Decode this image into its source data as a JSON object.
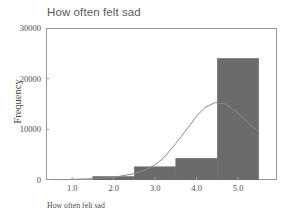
{
  "chart_data": {
    "type": "bar",
    "title": "How often felt sad",
    "xlabel": "How often felt sad",
    "ylabel": "Frequency",
    "xlim": [
      0.37,
      5.94
    ],
    "ylim": [
      0,
      30000
    ],
    "xticks": [
      "1.0",
      "2.0",
      "3.0",
      "4.0",
      "5.0"
    ],
    "xtick_values": [
      1.0,
      2.0,
      3.0,
      4.0,
      5.0
    ],
    "yticks": [
      "0",
      "10000",
      "20000",
      "30000"
    ],
    "ytick_values": [
      0,
      10000,
      20000,
      30000
    ],
    "grid": false,
    "legend": "none",
    "bin_width": 1.0,
    "bin_edges": [
      0.5,
      1.5,
      2.5,
      3.5,
      4.5,
      5.5
    ],
    "categories": [
      "1",
      "2",
      "3",
      "4",
      "5"
    ],
    "values": [
      0,
      700,
      2600,
      4300,
      24000
    ],
    "series": [
      {
        "name": "Frequency",
        "values": [
          0,
          700,
          2600,
          4300,
          24000
        ]
      },
      {
        "name": "Normal curve",
        "type": "line",
        "x": [
          0.5,
          1.0,
          1.5,
          2.0,
          2.5,
          2.8,
          3.0,
          3.2,
          3.5,
          3.8,
          4.0,
          4.2,
          4.45,
          4.7,
          5.0,
          5.3,
          5.5
        ],
        "values": [
          60,
          120,
          260,
          520,
          1250,
          2100,
          3000,
          4300,
          7200,
          10400,
          12600,
          14300,
          15300,
          15000,
          13200,
          10900,
          9500
        ]
      }
    ],
    "bar_color": "#6b6b6b",
    "line_color": "#8a8a8a",
    "frame_color": "#9a9a9a",
    "background": "#ffffff"
  }
}
